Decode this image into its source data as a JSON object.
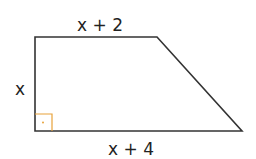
{
  "diagram": {
    "shape": "right trapezoid",
    "labels": {
      "top": "x + 2",
      "left": "x",
      "bottom": "x + 4"
    },
    "right_angle_marker": {
      "corner": "bottom-left",
      "color": "#e8a23a"
    },
    "colors": {
      "stroke": "#333333",
      "marker": "#e8a23a"
    }
  }
}
